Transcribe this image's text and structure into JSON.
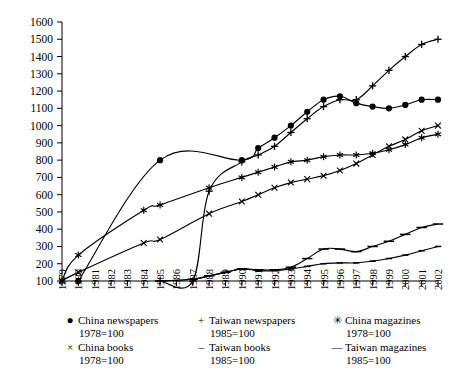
{
  "chart_data": {
    "type": "line",
    "title": "",
    "xlabel": "",
    "ylabel": "",
    "xlim": [
      1979,
      2002
    ],
    "ylim": [
      100,
      1600
    ],
    "grid": false,
    "legend_position": "bottom",
    "x": [
      1979,
      1980,
      1981,
      1982,
      1983,
      1984,
      1985,
      1986,
      1987,
      1988,
      1989,
      1990,
      1991,
      1992,
      1993,
      1994,
      1995,
      1996,
      1997,
      1998,
      1999,
      2000,
      2001,
      2002
    ],
    "y_ticks": [
      100,
      200,
      300,
      400,
      500,
      600,
      700,
      800,
      900,
      1000,
      1100,
      1200,
      1300,
      1400,
      1500,
      1600
    ],
    "x_tick_labels": [
      "1979",
      "1980",
      "1981",
      "1982",
      "1983",
      "1984",
      "1985",
      "1986",
      "1987",
      "1988",
      "1989",
      "1990",
      "1991",
      "1992",
      "1993",
      "1994",
      "1995",
      "1996",
      "1997",
      "1998",
      "1999",
      "2000",
      "2001",
      "2002"
    ],
    "series": [
      {
        "name": "China newspapers",
        "base": "1978=100",
        "marker": "filled-circle",
        "marker_glyph": "●",
        "color": "#000000",
        "x": [
          1980,
          1985,
          1990,
          1991,
          1992,
          1993,
          1994,
          1995,
          1996,
          1997,
          1998,
          1999,
          2000,
          2001,
          2002
        ],
        "values": [
          100,
          800,
          800,
          870,
          930,
          1000,
          1080,
          1150,
          1170,
          1130,
          1110,
          1100,
          1120,
          1150,
          1150
        ]
      },
      {
        "name": "Taiwan newspapers",
        "base": "1985=100",
        "marker": "plus",
        "marker_glyph": "+",
        "color": "#000000",
        "x": [
          1985,
          1987,
          1988,
          1990,
          1991,
          1992,
          1993,
          1994,
          1995,
          1996,
          1997,
          1998,
          1999,
          2000,
          2001,
          2002
        ],
        "values": [
          100,
          100,
          620,
          790,
          830,
          880,
          960,
          1040,
          1110,
          1150,
          1150,
          1230,
          1320,
          1400,
          1470,
          1500
        ]
      },
      {
        "name": "China magazines",
        "base": "1978=100",
        "marker": "star",
        "marker_glyph": "✳",
        "color": "#000000",
        "x": [
          1979,
          1980,
          1984,
          1985,
          1988,
          1990,
          1991,
          1992,
          1993,
          1994,
          1995,
          1996,
          1997,
          1998,
          1999,
          2000,
          2001,
          2002
        ],
        "values": [
          100,
          250,
          510,
          540,
          640,
          700,
          730,
          760,
          790,
          800,
          820,
          830,
          830,
          840,
          860,
          890,
          930,
          950
        ]
      },
      {
        "name": "China books",
        "base": "1978=100",
        "marker": "cross",
        "marker_glyph": "×",
        "color": "#000000",
        "x": [
          1979,
          1980,
          1984,
          1985,
          1988,
          1990,
          1991,
          1992,
          1993,
          1994,
          1995,
          1996,
          1997,
          1998,
          1999,
          2000,
          2001,
          2002
        ],
        "values": [
          100,
          150,
          320,
          340,
          490,
          560,
          600,
          640,
          670,
          690,
          710,
          740,
          780,
          830,
          880,
          920,
          970,
          1000
        ]
      },
      {
        "name": "Taiwan books",
        "base": "1985=100",
        "marker": "dash-short",
        "marker_glyph": "–",
        "color": "#000000",
        "x": [
          1985,
          1987,
          1988,
          1989,
          1990,
          1991,
          1992,
          1993,
          1994,
          1995,
          1996,
          1997,
          1998,
          1999,
          2000,
          2001,
          2002
        ],
        "values": [
          100,
          110,
          130,
          150,
          170,
          160,
          160,
          170,
          185,
          200,
          205,
          205,
          215,
          230,
          250,
          275,
          300
        ]
      },
      {
        "name": "Taiwan magazines",
        "base": "1985=100",
        "marker": "dash-long",
        "marker_glyph": "—",
        "color": "#000000",
        "x": [
          1985,
          1987,
          1988,
          1989,
          1990,
          1991,
          1992,
          1993,
          1994,
          1995,
          1996,
          1997,
          1998,
          1999,
          2000,
          2001,
          2002
        ],
        "values": [
          100,
          110,
          130,
          150,
          170,
          165,
          165,
          180,
          230,
          285,
          285,
          270,
          300,
          330,
          370,
          410,
          430
        ]
      }
    ]
  },
  "legend": {
    "entries": [
      {
        "marker": "●",
        "label": "China newspapers",
        "base": "1978=100"
      },
      {
        "marker": "+",
        "label": "Taiwan newspapers",
        "base": "1985=100"
      },
      {
        "marker": "✳",
        "label": "China magazines",
        "base": "1978=100"
      },
      {
        "marker": "×",
        "label": "China books",
        "base": "1978=100"
      },
      {
        "marker": "–",
        "label": "Taiwan books",
        "base": "1985=100"
      },
      {
        "marker": "—",
        "label": "Taiwan magazines",
        "base": "1985=100"
      }
    ]
  }
}
